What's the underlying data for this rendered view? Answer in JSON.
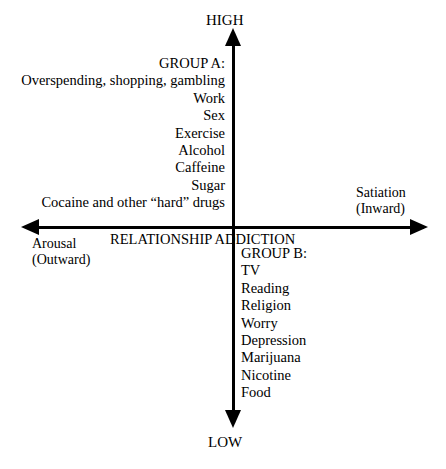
{
  "title_clipped": "ADDICTIONS",
  "axes": {
    "vertical": {
      "top_label": "HIGH",
      "bottom_label": "LOW"
    },
    "horizontal": {
      "right_label_line1": "Satiation",
      "right_label_line2": "(Inward)",
      "left_label_line1": "Arousal",
      "left_label_line2": "(Outward)"
    }
  },
  "center_caption": "RELATIONSHIP ADDICTION",
  "group_a": {
    "heading": "GROUP A:",
    "items": [
      "Overspending, shopping, gambling",
      "Work",
      "Sex",
      "Exercise",
      "Alcohol",
      "Caffeine",
      "Sugar",
      "Cocaine and other “hard” drugs"
    ]
  },
  "group_b": {
    "heading": "GROUP B:",
    "items": [
      "TV",
      "Reading",
      "Religion",
      "Worry",
      "Depression",
      "Marijuana",
      "Nicotine",
      "Food"
    ]
  },
  "colors": {
    "ink": "#000000",
    "background": "#ffffff"
  }
}
